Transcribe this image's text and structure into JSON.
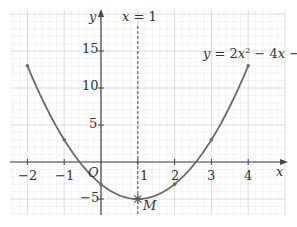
{
  "chart_data": {
    "type": "line",
    "title": "",
    "equation_label": "y = 2x² − 4x − 3",
    "symmetry_label": "x = 1",
    "xlabel": "x",
    "ylabel": "y",
    "origin_label": "O",
    "vertex_label": "M",
    "xlim": [
      -2.5,
      4.9
    ],
    "ylim": [
      -7,
      20.5
    ],
    "x_ticks": [
      -2,
      -1,
      1,
      2,
      3,
      4
    ],
    "y_ticks": [
      -5,
      5,
      10,
      15
    ],
    "grid": true,
    "series": [
      {
        "name": "y = 2x² − 4x − 3",
        "function": "2x^2 - 4x - 3",
        "x_range": [
          -2,
          4
        ],
        "marked_points": [
          {
            "x": -2,
            "y": 13
          },
          {
            "x": -1,
            "y": 3
          },
          {
            "x": 0,
            "y": -3
          },
          {
            "x": 1,
            "y": -5
          },
          {
            "x": 2,
            "y": -3
          },
          {
            "x": 3,
            "y": 3
          },
          {
            "x": 4,
            "y": 13
          }
        ]
      }
    ],
    "vertex": {
      "x": 1,
      "y": -5,
      "label": "M"
    },
    "axis_of_symmetry": {
      "x": 1,
      "style": "dashed"
    },
    "colors": {
      "curve": "#6a6a6a",
      "axes": "#444444",
      "grid_major": "#d9d9d9",
      "grid_minor": "#eeeeee",
      "dashed": "#555555"
    }
  },
  "labels": {
    "y_axis": "y",
    "x_axis": "x",
    "origin": "O",
    "symmetry": "x = 1",
    "equation": "y = 2x² − 4x − 3",
    "vertex": "M",
    "xt_m2": "−2",
    "xt_m1": "−1",
    "xt_1": "1",
    "xt_2": "2",
    "xt_3": "3",
    "xt_4": "4",
    "yt_15": "15",
    "yt_10": "10",
    "yt_5": "5",
    "yt_m5": "−5"
  }
}
